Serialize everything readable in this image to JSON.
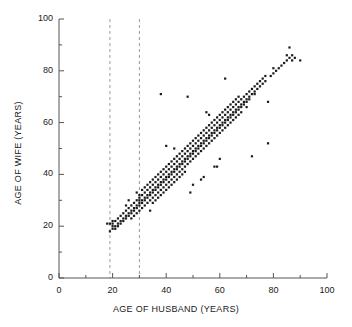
{
  "chart_data": {
    "type": "scatter",
    "title": "",
    "xlabel": "AGE OF HUSBAND (YEARS)",
    "ylabel": "AGE OF WIFE (YEARS)",
    "xlim": [
      0,
      100
    ],
    "ylim": [
      0,
      100
    ],
    "xticks": [
      0,
      20,
      40,
      60,
      80,
      100
    ],
    "yticks": [
      0,
      20,
      40,
      60,
      80,
      100
    ],
    "xtick_labels": [
      "0",
      "20",
      "40",
      "60",
      "80",
      "100"
    ],
    "ytick_labels": [
      "0",
      "20",
      "40",
      "60",
      "80",
      "100"
    ],
    "minor_tick_step": 10,
    "grid": false,
    "legend": null,
    "marker": {
      "shape": "square",
      "size_px": 2.2,
      "color": "#1a1a1a"
    },
    "reference_lines": [
      {
        "orientation": "vertical",
        "x": 19,
        "style": "dashed",
        "color": "#9a9a9a"
      },
      {
        "orientation": "vertical",
        "x": 30,
        "style": "dashed",
        "color": "#9a9a9a"
      }
    ],
    "n_points": 282,
    "points": [
      [
        18,
        21
      ],
      [
        19,
        21
      ],
      [
        19,
        18
      ],
      [
        20,
        19
      ],
      [
        20,
        21
      ],
      [
        20,
        22
      ],
      [
        20,
        20
      ],
      [
        21,
        20
      ],
      [
        21,
        22
      ],
      [
        21,
        19
      ],
      [
        22,
        21
      ],
      [
        22,
        23
      ],
      [
        22,
        20
      ],
      [
        23,
        22
      ],
      [
        23,
        24
      ],
      [
        23,
        21
      ],
      [
        24,
        23
      ],
      [
        24,
        25
      ],
      [
        24,
        22
      ],
      [
        25,
        24
      ],
      [
        25,
        26
      ],
      [
        25,
        23
      ],
      [
        25,
        28
      ],
      [
        26,
        25
      ],
      [
        26,
        27
      ],
      [
        26,
        24
      ],
      [
        26,
        30
      ],
      [
        27,
        26
      ],
      [
        27,
        28
      ],
      [
        27,
        25
      ],
      [
        27,
        23
      ],
      [
        28,
        27
      ],
      [
        28,
        29
      ],
      [
        28,
        26
      ],
      [
        28,
        24
      ],
      [
        29,
        28
      ],
      [
        29,
        30
      ],
      [
        29,
        27
      ],
      [
        29,
        25
      ],
      [
        29,
        33
      ],
      [
        30,
        29
      ],
      [
        30,
        31
      ],
      [
        30,
        28
      ],
      [
        30,
        26
      ],
      [
        30,
        30
      ],
      [
        30,
        32
      ],
      [
        31,
        30
      ],
      [
        31,
        32
      ],
      [
        31,
        29
      ],
      [
        31,
        27
      ],
      [
        31,
        34
      ],
      [
        32,
        31
      ],
      [
        32,
        33
      ],
      [
        32,
        30
      ],
      [
        32,
        28
      ],
      [
        32,
        35
      ],
      [
        33,
        32
      ],
      [
        33,
        34
      ],
      [
        33,
        31
      ],
      [
        33,
        29
      ],
      [
        33,
        36
      ],
      [
        34,
        33
      ],
      [
        34,
        35
      ],
      [
        34,
        32
      ],
      [
        34,
        30
      ],
      [
        34,
        37
      ],
      [
        34,
        26
      ],
      [
        35,
        34
      ],
      [
        35,
        36
      ],
      [
        35,
        33
      ],
      [
        35,
        31
      ],
      [
        35,
        38
      ],
      [
        35,
        29
      ],
      [
        36,
        35
      ],
      [
        36,
        37
      ],
      [
        36,
        34
      ],
      [
        36,
        32
      ],
      [
        36,
        39
      ],
      [
        36,
        30
      ],
      [
        37,
        36
      ],
      [
        37,
        38
      ],
      [
        37,
        35
      ],
      [
        37,
        33
      ],
      [
        37,
        40
      ],
      [
        37,
        31
      ],
      [
        38,
        37
      ],
      [
        38,
        39
      ],
      [
        38,
        36
      ],
      [
        38,
        34
      ],
      [
        38,
        41
      ],
      [
        38,
        32
      ],
      [
        38,
        71
      ],
      [
        39,
        38
      ],
      [
        39,
        40
      ],
      [
        39,
        37
      ],
      [
        39,
        35
      ],
      [
        39,
        42
      ],
      [
        39,
        33
      ],
      [
        40,
        39
      ],
      [
        40,
        41
      ],
      [
        40,
        38
      ],
      [
        40,
        36
      ],
      [
        40,
        43
      ],
      [
        40,
        34
      ],
      [
        40,
        51
      ],
      [
        41,
        40
      ],
      [
        41,
        42
      ],
      [
        41,
        39
      ],
      [
        41,
        37
      ],
      [
        41,
        44
      ],
      [
        41,
        35
      ],
      [
        42,
        41
      ],
      [
        42,
        43
      ],
      [
        42,
        40
      ],
      [
        42,
        38
      ],
      [
        42,
        45
      ],
      [
        42,
        36
      ],
      [
        43,
        42
      ],
      [
        43,
        44
      ],
      [
        43,
        41
      ],
      [
        43,
        39
      ],
      [
        43,
        46
      ],
      [
        43,
        37
      ],
      [
        43,
        50
      ],
      [
        44,
        43
      ],
      [
        44,
        45
      ],
      [
        44,
        42
      ],
      [
        44,
        40
      ],
      [
        44,
        47
      ],
      [
        44,
        38
      ],
      [
        45,
        44
      ],
      [
        45,
        46
      ],
      [
        45,
        43
      ],
      [
        45,
        41
      ],
      [
        45,
        48
      ],
      [
        45,
        39
      ],
      [
        46,
        45
      ],
      [
        46,
        47
      ],
      [
        46,
        44
      ],
      [
        46,
        42
      ],
      [
        46,
        49
      ],
      [
        46,
        40
      ],
      [
        47,
        46
      ],
      [
        47,
        48
      ],
      [
        47,
        45
      ],
      [
        47,
        43
      ],
      [
        47,
        50
      ],
      [
        47,
        41
      ],
      [
        48,
        47
      ],
      [
        48,
        49
      ],
      [
        48,
        46
      ],
      [
        48,
        44
      ],
      [
        48,
        51
      ],
      [
        48,
        70
      ],
      [
        49,
        48
      ],
      [
        49,
        50
      ],
      [
        49,
        47
      ],
      [
        49,
        45
      ],
      [
        49,
        52
      ],
      [
        49,
        33
      ],
      [
        50,
        49
      ],
      [
        50,
        51
      ],
      [
        50,
        48
      ],
      [
        50,
        46
      ],
      [
        50,
        53
      ],
      [
        50,
        36
      ],
      [
        51,
        50
      ],
      [
        51,
        52
      ],
      [
        51,
        49
      ],
      [
        51,
        47
      ],
      [
        51,
        54
      ],
      [
        52,
        51
      ],
      [
        52,
        53
      ],
      [
        52,
        50
      ],
      [
        52,
        48
      ],
      [
        52,
        55
      ],
      [
        53,
        52
      ],
      [
        53,
        54
      ],
      [
        53,
        51
      ],
      [
        53,
        49
      ],
      [
        53,
        56
      ],
      [
        53,
        38
      ],
      [
        54,
        53
      ],
      [
        54,
        55
      ],
      [
        54,
        52
      ],
      [
        54,
        50
      ],
      [
        54,
        57
      ],
      [
        54,
        39
      ],
      [
        55,
        54
      ],
      [
        55,
        56
      ],
      [
        55,
        53
      ],
      [
        55,
        51
      ],
      [
        55,
        58
      ],
      [
        55,
        64
      ],
      [
        56,
        55
      ],
      [
        56,
        57
      ],
      [
        56,
        54
      ],
      [
        56,
        52
      ],
      [
        56,
        59
      ],
      [
        56,
        63
      ],
      [
        57,
        56
      ],
      [
        57,
        58
      ],
      [
        57,
        55
      ],
      [
        57,
        53
      ],
      [
        57,
        60
      ],
      [
        58,
        57
      ],
      [
        58,
        59
      ],
      [
        58,
        56
      ],
      [
        58,
        54
      ],
      [
        58,
        61
      ],
      [
        58,
        43
      ],
      [
        59,
        58
      ],
      [
        59,
        60
      ],
      [
        59,
        57
      ],
      [
        59,
        55
      ],
      [
        59,
        62
      ],
      [
        59,
        43
      ],
      [
        60,
        59
      ],
      [
        60,
        61
      ],
      [
        60,
        58
      ],
      [
        60,
        56
      ],
      [
        60,
        63
      ],
      [
        60,
        46
      ],
      [
        61,
        60
      ],
      [
        61,
        62
      ],
      [
        61,
        59
      ],
      [
        61,
        57
      ],
      [
        61,
        64
      ],
      [
        62,
        61
      ],
      [
        62,
        63
      ],
      [
        62,
        60
      ],
      [
        62,
        58
      ],
      [
        62,
        65
      ],
      [
        62,
        77
      ],
      [
        63,
        62
      ],
      [
        63,
        64
      ],
      [
        63,
        61
      ],
      [
        63,
        59
      ],
      [
        63,
        66
      ],
      [
        64,
        63
      ],
      [
        64,
        65
      ],
      [
        64,
        62
      ],
      [
        64,
        60
      ],
      [
        64,
        67
      ],
      [
        65,
        64
      ],
      [
        65,
        66
      ],
      [
        65,
        63
      ],
      [
        65,
        61
      ],
      [
        65,
        68
      ],
      [
        66,
        65
      ],
      [
        66,
        67
      ],
      [
        66,
        64
      ],
      [
        66,
        62
      ],
      [
        66,
        69
      ],
      [
        67,
        66
      ],
      [
        67,
        68
      ],
      [
        67,
        65
      ],
      [
        67,
        63
      ],
      [
        67,
        70
      ],
      [
        68,
        67
      ],
      [
        68,
        69
      ],
      [
        68,
        66
      ],
      [
        68,
        64
      ],
      [
        69,
        68
      ],
      [
        69,
        70
      ],
      [
        69,
        67
      ],
      [
        70,
        69
      ],
      [
        70,
        71
      ],
      [
        70,
        68
      ],
      [
        70,
        66
      ],
      [
        71,
        70
      ],
      [
        71,
        72
      ],
      [
        71,
        69
      ],
      [
        72,
        71
      ],
      [
        72,
        73
      ],
      [
        72,
        47
      ],
      [
        73,
        72
      ],
      [
        73,
        74
      ],
      [
        73,
        71
      ],
      [
        74,
        73
      ],
      [
        74,
        75
      ],
      [
        75,
        74
      ],
      [
        75,
        76
      ],
      [
        76,
        75
      ],
      [
        76,
        77
      ],
      [
        77,
        76
      ],
      [
        77,
        78
      ],
      [
        78,
        52
      ],
      [
        78,
        68
      ],
      [
        79,
        78
      ],
      [
        80,
        79
      ],
      [
        80,
        81
      ],
      [
        81,
        80
      ],
      [
        82,
        81
      ],
      [
        83,
        82
      ],
      [
        84,
        83
      ],
      [
        85,
        84
      ],
      [
        85,
        86
      ],
      [
        86,
        85
      ],
      [
        86,
        89
      ],
      [
        87,
        84
      ],
      [
        87,
        86
      ],
      [
        88,
        85
      ],
      [
        90,
        84
      ]
    ]
  }
}
